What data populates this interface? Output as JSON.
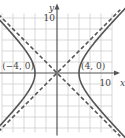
{
  "chart_data": {
    "type": "line",
    "title": "",
    "equation": "x^2/16 - y^2/16 = 1",
    "xlabel": "x",
    "ylabel": "y",
    "xlim": [
      -10,
      10
    ],
    "ylim": [
      -11,
      11
    ],
    "grid": true,
    "grid_step": 2,
    "tick_labels": {
      "x": "10",
      "y": "10"
    },
    "series": [
      {
        "name": "hyperbola-right-branch",
        "style": "solid",
        "vertex": [
          4,
          0
        ],
        "a": 4,
        "b": 4,
        "branch": "right"
      },
      {
        "name": "hyperbola-left-branch",
        "style": "solid",
        "vertex": [
          -4,
          0
        ],
        "a": 4,
        "b": 4,
        "branch": "left"
      },
      {
        "name": "asymptote-positive",
        "style": "dashed",
        "slope": 1,
        "intercept": 0
      },
      {
        "name": "asymptote-negative",
        "style": "dashed",
        "slope": -1,
        "intercept": 0
      }
    ],
    "annotations": [
      {
        "text": "(−4, 0)",
        "x": -4,
        "y": 0
      },
      {
        "text": "(4, 0)",
        "x": 4,
        "y": 0
      }
    ],
    "colors": {
      "curve": "#555555",
      "grid": "#cfcfcf",
      "axis": "#555555",
      "text": "#444444"
    }
  }
}
